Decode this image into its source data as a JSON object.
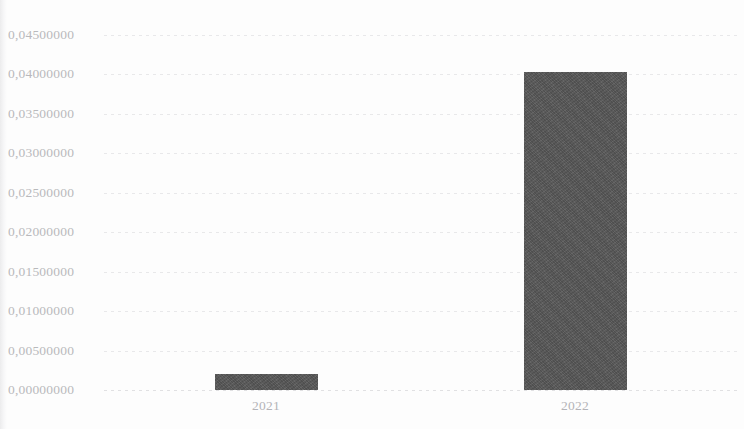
{
  "chart_data": {
    "type": "bar",
    "title": "",
    "subtitle": "",
    "xlabel": "",
    "ylabel": "",
    "categories": [
      "2021",
      "2022"
    ],
    "values": [
      0.00205,
      0.0403
    ],
    "series": [
      {
        "name": "",
        "values": [
          0.00205,
          0.0403
        ]
      }
    ],
    "ylim": [
      0.0,
      0.045
    ],
    "ytick_values": [
      0.0,
      0.005,
      0.01,
      0.015,
      0.02,
      0.025,
      0.03,
      0.035,
      0.04,
      0.045
    ],
    "ytick_labels": [
      "0,00000000",
      "0,00500000",
      "0,01000000",
      "0,01500000",
      "0,02000000",
      "0,02500000",
      "0,03000000",
      "0,03500000",
      "0,04000000",
      "0,04500000"
    ],
    "decimal_separator": ",",
    "grid": true,
    "grid_axis": "y",
    "grid_style": "dotted",
    "legend": false,
    "legend_position": "none",
    "bar_color": "#575757",
    "grid_color": "#d7d7da",
    "label_color": "#b9b9bc",
    "background_color": "#fdfdfd",
    "annotations": []
  }
}
